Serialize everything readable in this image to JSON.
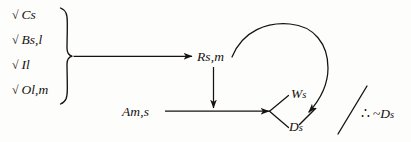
{
  "diagram": {
    "ink_color": "#16120f",
    "background_color": "#fdfdfc",
    "check_glyph": "√",
    "premises": [
      {
        "check": "√",
        "label": "Cs"
      },
      {
        "check": "√",
        "label": "Bs,l"
      },
      {
        "check": "√",
        "label": "Il"
      },
      {
        "check": "√",
        "label": "Ol,m"
      }
    ],
    "nodes": {
      "rsm": "Rs,m",
      "ams": "Am,s",
      "ws": {
        "base": "W",
        "sub": "s"
      },
      "ds": {
        "base": "D",
        "sub": "s"
      }
    },
    "conclusion": {
      "therefore": "∴",
      "negation": "~",
      "term": "D",
      "term_sub": "s",
      "full": "∴ ~Ds"
    },
    "marks": {
      "brace": "right-curly-brace",
      "discharge_slash": "discharge-slash",
      "strike_slash": "arrowhead-strike"
    }
  }
}
